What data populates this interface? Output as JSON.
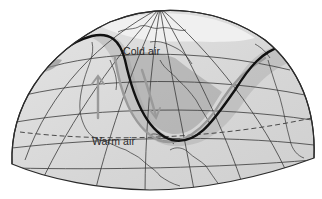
{
  "diagram": {
    "labels": {
      "cold_air": "Cold air",
      "warm_air": "Warm air"
    },
    "colors": {
      "background": "#ffffff",
      "globe_fill": "#d9d9d9",
      "cold_air_fill": "#a9a9a9",
      "jet_stream": "#111111",
      "grid_lines": "#3a3a3a",
      "coastlines": "#333333",
      "flow_arrows": "#9a9a9a",
      "polar_highlight": "#f2f2f2"
    },
    "elements": [
      "globe-hemisphere",
      "latitude-longitude-grid",
      "coastlines",
      "jet-stream-line",
      "cold-air-trough-shading",
      "airflow-arrows",
      "dashed-latitude-line"
    ]
  }
}
